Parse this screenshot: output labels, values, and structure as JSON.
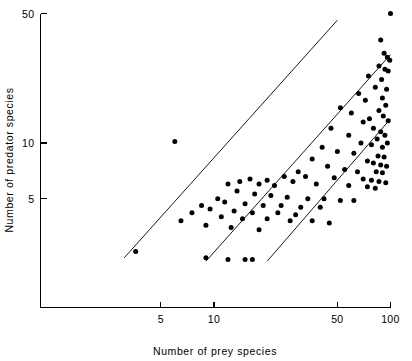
{
  "chart_data": {
    "type": "scatter",
    "title": "",
    "xlabel": "Number of prey species",
    "ylabel": "Number of predator species",
    "xscale": "log",
    "yscale": "log",
    "xlim": [
      2,
      110
    ],
    "ylim": [
      1.8,
      55
    ],
    "grid": false,
    "legend": null,
    "xticks": [
      5,
      10,
      50,
      100
    ],
    "xtick_labels": [
      "5",
      "10",
      "50",
      "100"
    ],
    "yticks": [
      5,
      10,
      50
    ],
    "ytick_labels": [
      "5",
      "10",
      "50"
    ],
    "annotations": [
      "Three parallel reference lines of slope 1 on log-log axes",
      "Predator-prey species richness relationship"
    ],
    "reference_lines": [
      {
        "name": "upper-reference-line",
        "x1": 3.1,
        "y1": 2.4,
        "x2": 50.0,
        "y2": 46.0
      },
      {
        "name": "middle-reference-line",
        "x1": 9.0,
        "y1": 2.3,
        "x2": 100.0,
        "y2": 30.0
      },
      {
        "name": "lower-reference-line",
        "x1": 20.0,
        "y1": 2.3,
        "x2": 100.0,
        "y2": 13.5
      }
    ],
    "series": [
      {
        "name": "communities",
        "marker": "filled-circle",
        "color": "#000000",
        "n_points": 104,
        "points": [
          [
            6.0,
            10.2
          ],
          [
            100.0,
            50.0
          ],
          [
            88.0,
            36.0
          ],
          [
            92.0,
            30.5
          ],
          [
            96.0,
            29.0
          ],
          [
            99.0,
            28.0
          ],
          [
            86.0,
            26.0
          ],
          [
            93.0,
            25.0
          ],
          [
            97.0,
            24.5
          ],
          [
            75.0,
            23.0
          ],
          [
            89.0,
            22.0
          ],
          [
            82.0,
            20.0
          ],
          [
            66.0,
            18.5
          ],
          [
            95.0,
            19.5
          ],
          [
            90.0,
            17.5
          ],
          [
            72.0,
            17.0
          ],
          [
            94.0,
            16.0
          ],
          [
            86.0,
            15.0
          ],
          [
            52.0,
            15.5
          ],
          [
            60.0,
            14.5
          ],
          [
            91.0,
            14.0
          ],
          [
            76.0,
            13.5
          ],
          [
            70.0,
            13.0
          ],
          [
            97.0,
            13.2
          ],
          [
            80.0,
            12.0
          ],
          [
            88.0,
            11.5
          ],
          [
            46.0,
            12.0
          ],
          [
            58.0,
            11.0
          ],
          [
            93.0,
            11.0
          ],
          [
            84.0,
            10.5
          ],
          [
            68.0,
            10.0
          ],
          [
            78.0,
            9.8
          ],
          [
            96.0,
            10.0
          ],
          [
            90.0,
            9.5
          ],
          [
            41.0,
            9.5
          ],
          [
            50.0,
            9.0
          ],
          [
            62.0,
            8.8
          ],
          [
            85.0,
            8.5
          ],
          [
            92.0,
            8.4
          ],
          [
            74.0,
            8.0
          ],
          [
            80.0,
            7.8
          ],
          [
            88.0,
            7.6
          ],
          [
            95.0,
            7.5
          ],
          [
            36.0,
            8.2
          ],
          [
            44.0,
            7.5
          ],
          [
            55.0,
            7.2
          ],
          [
            65.0,
            7.0
          ],
          [
            83.0,
            7.0
          ],
          [
            90.0,
            6.9
          ],
          [
            30.0,
            7.0
          ],
          [
            33.0,
            6.6
          ],
          [
            48.0,
            6.5
          ],
          [
            70.0,
            6.4
          ],
          [
            78.0,
            6.3
          ],
          [
            86.0,
            6.2
          ],
          [
            94.0,
            6.1
          ],
          [
            25.0,
            6.6
          ],
          [
            28.0,
            6.2
          ],
          [
            38.0,
            6.0
          ],
          [
            58.0,
            5.9
          ],
          [
            74.0,
            5.8
          ],
          [
            82.0,
            5.7
          ],
          [
            20.0,
            6.3
          ],
          [
            22.0,
            5.9
          ],
          [
            16.0,
            6.4
          ],
          [
            18.0,
            6.0
          ],
          [
            14.0,
            6.2
          ],
          [
            12.0,
            6.0
          ],
          [
            13.5,
            5.5
          ],
          [
            17.0,
            5.3
          ],
          [
            21.0,
            5.2
          ],
          [
            26.0,
            5.1
          ],
          [
            34.0,
            5.0
          ],
          [
            42.0,
            5.0
          ],
          [
            52.0,
            4.9
          ],
          [
            62.0,
            4.9
          ],
          [
            10.5,
            5.0
          ],
          [
            11.5,
            4.8
          ],
          [
            15.0,
            4.7
          ],
          [
            19.0,
            4.6
          ],
          [
            24.0,
            4.6
          ],
          [
            31.0,
            4.5
          ],
          [
            40.0,
            4.5
          ],
          [
            8.5,
            4.6
          ],
          [
            9.5,
            4.4
          ],
          [
            13.0,
            4.3
          ],
          [
            16.5,
            4.2
          ],
          [
            23.0,
            4.2
          ],
          [
            29.0,
            4.1
          ],
          [
            7.5,
            4.2
          ],
          [
            11.0,
            4.0
          ],
          [
            14.5,
            3.9
          ],
          [
            20.0,
            3.9
          ],
          [
            27.0,
            3.8
          ],
          [
            36.0,
            3.8
          ],
          [
            45.0,
            3.7
          ],
          [
            6.5,
            3.8
          ],
          [
            9.0,
            3.6
          ],
          [
            12.5,
            3.5
          ],
          [
            18.0,
            3.4
          ],
          [
            3.6,
            2.6
          ],
          [
            9.0,
            2.4
          ],
          [
            12.0,
            2.35
          ],
          [
            15.0,
            2.35
          ],
          [
            16.5,
            2.35
          ]
        ]
      }
    ]
  },
  "axes": {
    "x_axis": {
      "label": "Number of prey species",
      "ticks": [
        {
          "value": 5,
          "label": "5"
        },
        {
          "value": 10,
          "label": "10"
        },
        {
          "value": 50,
          "label": "50"
        },
        {
          "value": 100,
          "label": "100"
        }
      ]
    },
    "y_axis": {
      "label": "Number of predator species",
      "ticks": [
        {
          "value": 5,
          "label": "5"
        },
        {
          "value": 10,
          "label": "10"
        },
        {
          "value": 50,
          "label": "50"
        }
      ]
    }
  },
  "style": {
    "marker_color": "#000000",
    "axis_color": "#000000",
    "line_color": "#000000",
    "background": "#ffffff",
    "marker_radius": 2.5
  }
}
